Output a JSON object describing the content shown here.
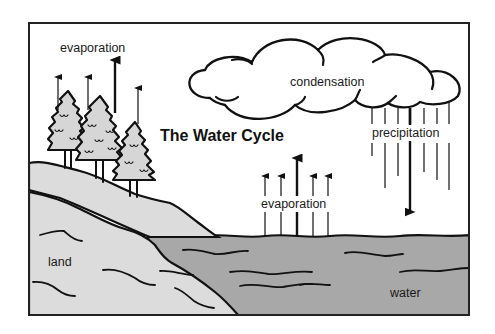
{
  "diagram": {
    "title": "The Water Cycle",
    "labels": {
      "evaporation_trees": "evaporation",
      "condensation": "condensation",
      "precipitation": "precipitation",
      "evaporation_water": "evaporation",
      "land": "land",
      "water": "water"
    },
    "colors": {
      "background": "#ffffff",
      "frame": "#222222",
      "land": "#dcdcdc",
      "water": "#a8a8a8",
      "tree_fill": "#d6d6d6",
      "ink": "#111111"
    },
    "elements": [
      {
        "id": "cloud",
        "label": "condensation"
      },
      {
        "id": "trees",
        "count": 3
      },
      {
        "id": "evaporation-arrows-trees",
        "count": 4,
        "direction": "up"
      },
      {
        "id": "precipitation-lines",
        "count": 7,
        "direction": "down"
      },
      {
        "id": "evaporation-arrows-water",
        "count": 5,
        "direction": "up"
      },
      {
        "id": "land-slope"
      },
      {
        "id": "water-body"
      }
    ]
  }
}
